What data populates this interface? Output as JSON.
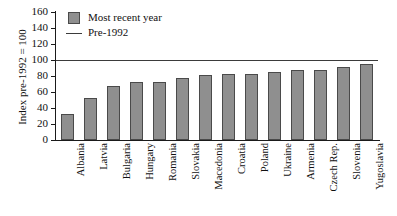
{
  "chart_data": {
    "type": "bar",
    "title": "",
    "xlabel": "",
    "ylabel": "Index pre-1992 = 100",
    "ylim": [
      0,
      160
    ],
    "ytick_step": 20,
    "yticks": [
      160,
      140,
      120,
      100,
      80,
      60,
      40,
      20,
      0
    ],
    "grid": false,
    "legend_position": "top-left",
    "categories": [
      "Albania",
      "Latvia",
      "Bulgaria",
      "Hungary",
      "Romania",
      "Slovakia",
      "Macedonia",
      "Croatia",
      "Poland",
      "Ukraine",
      "Armenia",
      "Czech Rep.",
      "Slovenia",
      "Yugoslavia"
    ],
    "series": [
      {
        "name": "Most recent year",
        "type": "bar",
        "color": "#8f8f8f",
        "edge_color": "#4a4a4a",
        "values": [
          33,
          52,
          68,
          72,
          73,
          77,
          81,
          82,
          83,
          85,
          87,
          88,
          91,
          95
        ]
      },
      {
        "name": "Pre-1992",
        "type": "reference-line",
        "color": "#3b3b3b",
        "value": 100
      }
    ],
    "legend": [
      {
        "label": "Most recent year",
        "marker": "square-swatch"
      },
      {
        "label": "Pre-1992",
        "marker": "line"
      }
    ]
  }
}
